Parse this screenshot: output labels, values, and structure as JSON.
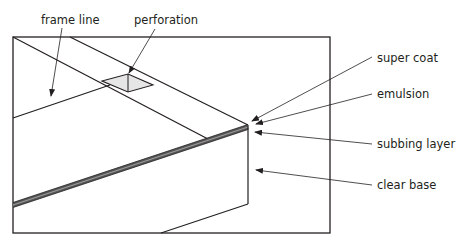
{
  "labels": {
    "frame_line": "frame line",
    "perforation": "perforation",
    "super_coat": "super coat",
    "emulsion": "emulsion",
    "subbing_layer": "subbing layer",
    "clear_base": "clear base"
  },
  "colors": {
    "line": "#231f20",
    "perforation_fill": "#e6e6e6",
    "layer_dark": "#555555",
    "layer_mid": "#9a9a9a"
  }
}
